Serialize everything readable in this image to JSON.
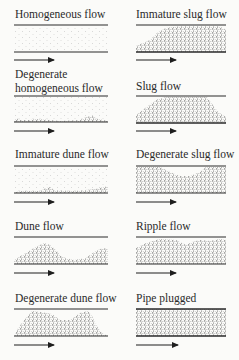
{
  "figure": {
    "colors": {
      "line": "#2a2a2a",
      "particle": "#333333",
      "background": "#fbfbf9"
    },
    "panels": [
      {
        "id": "homogeneous",
        "label": "Homogeneous flow",
        "column": "left",
        "row": 1,
        "pattern": "uniform-sparse"
      },
      {
        "id": "immature-slug",
        "label": "Immature slug flow",
        "column": "right",
        "row": 1,
        "pattern": "wedge-slug"
      },
      {
        "id": "degenerate-homogeneous",
        "label_lines": [
          "Degenerate",
          "homogeneous flow"
        ],
        "column": "left",
        "row": 2,
        "pattern": "sparse-with-bed-traces"
      },
      {
        "id": "slug",
        "label": "Slug flow",
        "column": "right",
        "row": 2,
        "pattern": "trapezoid-slug"
      },
      {
        "id": "immature-dune",
        "label": "Immature dune flow",
        "column": "left",
        "row": 3,
        "pattern": "sparse-with-thin-bed"
      },
      {
        "id": "degenerate-slug",
        "label": "Degenerate slug flow",
        "column": "right",
        "row": 3,
        "pattern": "near-full-with-dip"
      },
      {
        "id": "dune",
        "label": "Dune flow",
        "column": "left",
        "row": 4,
        "pattern": "dunes"
      },
      {
        "id": "ripple",
        "label": "Ripple flow",
        "column": "right",
        "row": 4,
        "pattern": "near-full-rippled"
      },
      {
        "id": "degenerate-dune",
        "label": "Degenerate dune flow",
        "column": "left",
        "row": 5,
        "pattern": "large-dunes"
      },
      {
        "id": "pipe-plugged",
        "label": "Pipe plugged",
        "column": "right",
        "row": 5,
        "pattern": "full"
      }
    ],
    "flow_direction": "left-to-right arrow under each pipe"
  }
}
